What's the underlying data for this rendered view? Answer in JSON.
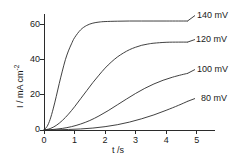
{
  "chart_data": {
    "type": "line",
    "title": "",
    "xlabel": "t /s",
    "ylabel": "I / mA cm-2",
    "ylabel_base": "I / mA cm",
    "ylabel_exponent": "-2",
    "xlim": [
      0,
      5.6
    ],
    "ylim": [
      0,
      66
    ],
    "xticks": [
      "0",
      "1",
      "2",
      "3",
      "4",
      "5"
    ],
    "xtick_values": [
      0,
      1,
      2,
      3,
      4,
      5
    ],
    "yticks": [
      "0",
      "20",
      "40",
      "60"
    ],
    "ytick_values": [
      0,
      20,
      40,
      60
    ],
    "grid": false,
    "legend_position": "right-inline-labels",
    "line_color": "#2b2b2b",
    "axis_color": "#2b2b2b",
    "series": [
      {
        "name": "140 mV",
        "label": "140 mV",
        "plateau": 62,
        "x": [
          0,
          0.1,
          0.2,
          0.3,
          0.4,
          0.5,
          0.6,
          0.7,
          0.8,
          0.9,
          1.0,
          1.2,
          1.4,
          1.6,
          1.8,
          2.0,
          2.4,
          2.8,
          3.2,
          3.6,
          4.0,
          4.4,
          4.7
        ],
        "values": [
          0,
          2.0,
          6.0,
          12.0,
          19.0,
          26.5,
          33.5,
          40.0,
          45.0,
          49.0,
          52.5,
          57.0,
          59.5,
          60.8,
          61.4,
          61.7,
          61.9,
          62.0,
          62.0,
          62.0,
          62.0,
          62.0,
          62.0
        ]
      },
      {
        "name": "120 mV",
        "label": "120 mV",
        "plateau": 50,
        "x": [
          0,
          0.2,
          0.4,
          0.6,
          0.8,
          1.0,
          1.2,
          1.4,
          1.6,
          1.8,
          2.0,
          2.2,
          2.4,
          2.6,
          2.8,
          3.0,
          3.2,
          3.4,
          3.6,
          4.0,
          4.4,
          4.7
        ],
        "values": [
          0,
          0.8,
          2.6,
          5.4,
          9.0,
          13.2,
          17.8,
          22.4,
          27.0,
          31.2,
          35.2,
          38.6,
          41.5,
          43.8,
          45.7,
          47.1,
          48.2,
          48.9,
          49.4,
          49.9,
          50.0,
          50.0
        ]
      },
      {
        "name": "100 mV",
        "label": "100 mV",
        "plateau": 33,
        "x": [
          0,
          0.3,
          0.6,
          0.9,
          1.2,
          1.5,
          1.8,
          2.1,
          2.4,
          2.7,
          3.0,
          3.3,
          3.6,
          3.9,
          4.2,
          4.5,
          4.7
        ],
        "values": [
          0,
          0.3,
          0.9,
          1.9,
          3.4,
          5.4,
          8.0,
          11.0,
          14.3,
          17.6,
          20.8,
          23.7,
          26.2,
          28.3,
          30.0,
          31.4,
          32.2
        ]
      },
      {
        "name": "80 mV",
        "label": "80 mV",
        "plateau": 18,
        "x": [
          0,
          0.4,
          0.8,
          1.2,
          1.6,
          2.0,
          2.4,
          2.8,
          3.2,
          3.6,
          4.0,
          4.4,
          4.7
        ],
        "values": [
          0,
          0.1,
          0.3,
          0.6,
          1.1,
          1.9,
          3.0,
          4.5,
          6.4,
          8.6,
          11.2,
          14.0,
          16.3
        ]
      }
    ]
  },
  "axes": {
    "y_title_base": "I / mA cm",
    "y_title_exp": "-2",
    "x_title": "t /s"
  },
  "labels": {
    "s140": "140 mV",
    "s120": "120 mV",
    "s100": "100 mV",
    "s80": "80 mV"
  },
  "ticks": {
    "x": [
      "0",
      "1",
      "2",
      "3",
      "4",
      "5"
    ],
    "y": [
      "0",
      "20",
      "40",
      "60"
    ]
  }
}
